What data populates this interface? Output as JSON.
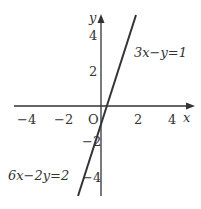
{
  "graph": {
    "origin_label": "O",
    "x_axis_label": "x",
    "y_axis_label": "y",
    "x_ticks": [
      {
        "value": -4,
        "label": "−4"
      },
      {
        "value": -2,
        "label": "−2"
      },
      {
        "value": 2,
        "label": "2"
      },
      {
        "value": 4,
        "label": "4"
      }
    ],
    "y_ticks": [
      {
        "value": 4,
        "label": "4"
      },
      {
        "value": 2,
        "label": "2"
      },
      {
        "value": -2,
        "label": "−2"
      },
      {
        "value": -4,
        "label": "−4"
      }
    ],
    "line": {
      "equation_upper": "3x−y=1",
      "equation_lower": "6x−2y=2",
      "slope": 3,
      "intercept": -1,
      "x_range": [
        -1.33,
        2.0
      ],
      "color": "#333333"
    },
    "axis_color": "#333333"
  }
}
